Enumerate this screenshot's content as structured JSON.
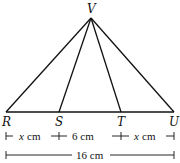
{
  "diagram": {
    "type": "geometry-triangle",
    "points": {
      "V": {
        "label": "V"
      },
      "R": {
        "label": "R"
      },
      "S": {
        "label": "S"
      },
      "T": {
        "label": "T"
      },
      "U": {
        "label": "U"
      }
    },
    "segments": [
      "VR",
      "VS",
      "VT",
      "VU",
      "RU"
    ],
    "dimensions": {
      "rs": {
        "var": "x",
        "unit": "cm"
      },
      "st": {
        "value": "6 cm"
      },
      "tu": {
        "var": "x",
        "unit": "cm"
      },
      "ru": {
        "value": "16 cm"
      }
    }
  }
}
